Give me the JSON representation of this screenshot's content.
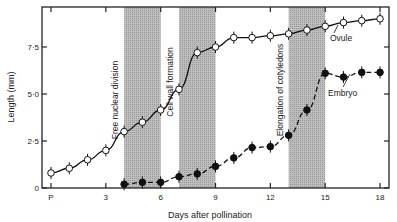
{
  "chart_data": {
    "type": "line",
    "title": "",
    "xlabel": "Days after pollination",
    "ylabel": "Length (mm)",
    "x_ticks": [
      "P",
      "3",
      "6",
      "9",
      "12",
      "15",
      "18"
    ],
    "x_tick_values": [
      0,
      3,
      6,
      9,
      12,
      15,
      18
    ],
    "y_ticks": [
      "0",
      "2·5",
      "5·0",
      "7·5"
    ],
    "y_tick_values": [
      0,
      2.5,
      5.0,
      7.5
    ],
    "xlim": [
      -1.5,
      18.5
    ],
    "ylim": [
      0,
      9.6
    ],
    "grid": false,
    "series": [
      {
        "name": "Ovule",
        "marker": "open-circle",
        "line": "solid",
        "x": [
          0,
          1,
          2,
          3,
          4,
          5,
          6,
          7,
          8,
          9,
          10,
          11,
          12,
          13,
          14,
          15,
          16,
          17,
          18
        ],
        "values": [
          0.8,
          1.05,
          1.5,
          2.0,
          3.0,
          3.5,
          4.15,
          5.25,
          7.2,
          7.5,
          8.0,
          8.0,
          8.1,
          8.2,
          8.4,
          8.6,
          8.8,
          8.9,
          9.0
        ]
      },
      {
        "name": "Embryo",
        "marker": "filled-circle",
        "line": "dashed",
        "x": [
          4,
          5,
          6,
          7,
          8,
          9,
          10,
          11,
          12,
          13,
          14,
          15,
          16,
          17,
          18
        ],
        "values": [
          0.2,
          0.3,
          0.3,
          0.6,
          0.75,
          1.15,
          1.6,
          2.15,
          2.2,
          2.8,
          4.15,
          6.1,
          5.9,
          6.15,
          6.15
        ]
      }
    ],
    "shaded_regions": [
      {
        "label": "Free nuclear division",
        "x_start": 4,
        "x_end": 6
      },
      {
        "label": "Cell wall formation",
        "x_start": 7,
        "x_end": 9
      },
      {
        "label": "Elongation of cotyledons",
        "x_start": 13,
        "x_end": 15
      }
    ],
    "annotations": [
      {
        "text": "Ovule",
        "near_series": "Ovule"
      },
      {
        "text": "Embryo",
        "near_series": "Embryo"
      }
    ]
  },
  "labels": {
    "xlabel": "Days after pollination",
    "ylabel": "Length (mm)",
    "ovule": "Ovule",
    "embryo": "Embryo",
    "region1": "Free nuclear division",
    "region2": "Cell wall formation",
    "region3": "Elongation of cotyledons"
  }
}
